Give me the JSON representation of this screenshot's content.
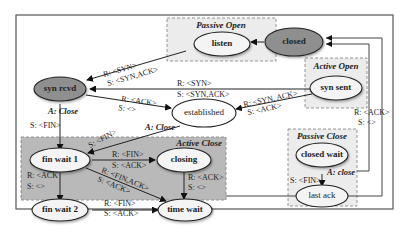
{
  "diagram": {
    "type": "state-machine",
    "groups": {
      "passive_open": "Passive Open",
      "active_open": "Active Open",
      "active_close": "Active Close",
      "passive_close": "Passive Close"
    },
    "nodes": {
      "closed": "closed",
      "listen": "listen",
      "syn_rcvd": "syn rcvd",
      "syn_sent": "syn sent",
      "established": "established",
      "fin_wait_1": "fin wait 1",
      "fin_wait_2": "fin wait 2",
      "closing": "closing",
      "time_wait": "time wait",
      "closed_wait": "closed wait",
      "last_ack": "last ack"
    },
    "edges": {
      "listen_to_synrcvd": {
        "r": "R: <SYN>",
        "s": "S: <SYN,ACK>"
      },
      "synsent_to_synrcvd": {
        "r": "R: <SYN>",
        "s": "S: <SYN,ACK>"
      },
      "synrcvd_to_established": {
        "r": "R: <ACK>",
        "s": "S: <>"
      },
      "synsent_to_established": {
        "r": "R: <SYN, ACK>",
        "s": "S: <ACK>"
      },
      "synrcvd_to_finwait1": {
        "a": "A: Close",
        "s": "S: <FIN>"
      },
      "established_to_finwait1": {
        "a": "A: Close",
        "s": "S: <FIN>"
      },
      "finwait1_to_closing": {
        "r": "R: <FIN>",
        "s": "S: <ACK>"
      },
      "finwait1_to_finwait2": {
        "r": "R: <ACK",
        "s": "S: <>"
      },
      "finwait1_to_timewait": {
        "r": "R: <FIN,ACK>",
        "s": "S: <ACK>"
      },
      "closing_to_timewait": {
        "r": "R: <ACK>",
        "s": "S: <>"
      },
      "finwait2_to_timewait": {
        "r": "R: <FIN>",
        "s": "S: <ACK>"
      },
      "closedwait_to_lastack": {
        "a": "A: close",
        "s": "S: <FIN>"
      },
      "lastack_to_closed": {
        "r": "R: <ACK>",
        "s": "S: <>"
      }
    },
    "colors": {
      "dark_node": "#8f8f8f",
      "light_node": "#f4f4f4",
      "active_close_bg": "#b9b9b9",
      "group_bg": "#ececec"
    }
  }
}
